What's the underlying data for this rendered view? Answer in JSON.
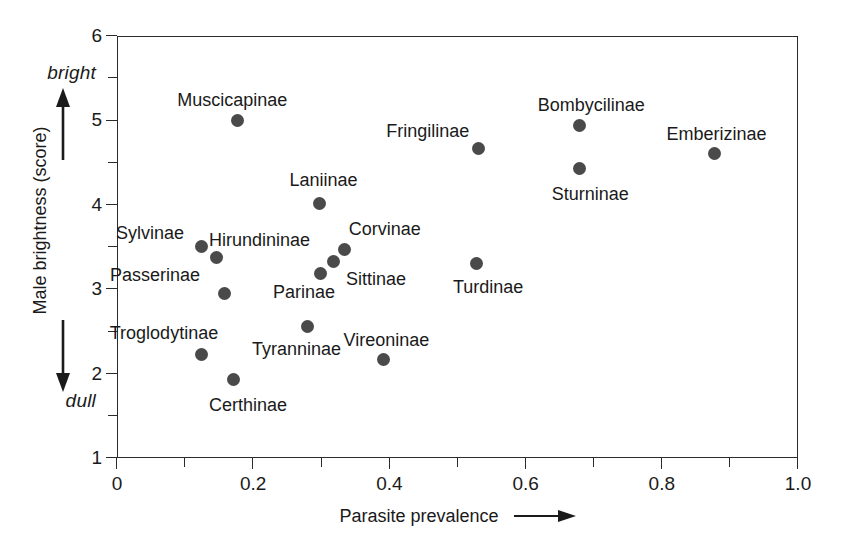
{
  "chart_data": {
    "type": "scatter",
    "title": "",
    "xlabel": "Parasite prevalence",
    "ylabel": "Male brightness (score)",
    "xlim": [
      0,
      1.0
    ],
    "ylim": [
      1,
      6
    ],
    "grid": false,
    "legend": "none",
    "x_ticks": [
      "0",
      "0.2",
      "0.4",
      "0.6",
      "0.8",
      "1.0"
    ],
    "x_tick_values": [
      0,
      0.2,
      0.4,
      0.6,
      0.8,
      1.0
    ],
    "x_minor_ticks": [
      0.1,
      0.3,
      0.5,
      0.7,
      0.9
    ],
    "y_ticks": [
      "1",
      "2",
      "3",
      "4",
      "5",
      "6"
    ],
    "y_tick_values": [
      1,
      2,
      3,
      4,
      5,
      6
    ],
    "y_minor_ticks": [
      1.5,
      2.5,
      3.5,
      4.5,
      5.5
    ],
    "y_axis_top_annotation": "bright",
    "y_axis_bottom_annotation": "dull",
    "points": [
      {
        "label": "Muscicapinae",
        "x": 0.175,
        "y": 5.01,
        "label_dx": -60,
        "label_dy": -30
      },
      {
        "label": "Sylvinae",
        "x": 0.122,
        "y": 3.52,
        "label_dx": -85,
        "label_dy": -22
      },
      {
        "label": "Hirundininae",
        "x": 0.144,
        "y": 3.39,
        "label_dx": -7,
        "label_dy": -26
      },
      {
        "label": "Passerinae",
        "x": 0.157,
        "y": 2.96,
        "label_dx": -115,
        "label_dy": -28
      },
      {
        "label": "Parinae",
        "x": 0.298,
        "y": 3.2,
        "label_dx": -48,
        "label_dy": 10
      },
      {
        "label": "Sittinae",
        "x": 0.317,
        "y": 3.34,
        "label_dx": 12,
        "label_dy": 8
      },
      {
        "label": "Corvinae",
        "x": 0.333,
        "y": 3.48,
        "label_dx": 4,
        "label_dy": -30
      },
      {
        "label": "Laniinae",
        "x": 0.296,
        "y": 4.03,
        "label_dx": -30,
        "label_dy": -32
      },
      {
        "label": "Troglodytinae",
        "x": 0.123,
        "y": 2.24,
        "label_dx": -92,
        "label_dy": -30
      },
      {
        "label": "Certhinae",
        "x": 0.169,
        "y": 1.94,
        "label_dx": -24,
        "label_dy": 16
      },
      {
        "label": "Tyranninae",
        "x": 0.279,
        "y": 2.57,
        "label_dx": -56,
        "label_dy": 14
      },
      {
        "label": "Vireoninae",
        "x": 0.39,
        "y": 2.18,
        "label_dx": -40,
        "label_dy": -28
      },
      {
        "label": "Fringilinae",
        "x": 0.529,
        "y": 4.68,
        "label_dx": -92,
        "label_dy": -26
      },
      {
        "label": "Turdinae",
        "x": 0.527,
        "y": 3.32,
        "label_dx": -24,
        "label_dy": 15
      },
      {
        "label": "Bombycilinae",
        "x": 0.678,
        "y": 4.95,
        "label_dx": -42,
        "label_dy": -30
      },
      {
        "label": "Sturninae",
        "x": 0.678,
        "y": 4.44,
        "label_dx": -28,
        "label_dy": 16
      },
      {
        "label": "Emberizinae",
        "x": 0.876,
        "y": 4.62,
        "label_dx": -48,
        "label_dy": -28
      }
    ]
  }
}
